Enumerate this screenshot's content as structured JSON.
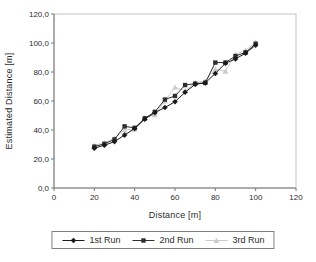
{
  "chart_data": {
    "type": "line",
    "title": "",
    "xlabel": "Distance [m]",
    "ylabel": "Estimated Distance [m]",
    "xlim": [
      0,
      120
    ],
    "ylim": [
      0,
      120
    ],
    "grid": false,
    "legend_position": "bottom",
    "x_tick_labels": [
      "0",
      "20",
      "40",
      "60",
      "80",
      "100",
      "120"
    ],
    "y_tick_labels": [
      "0,0",
      "20,0",
      "40,0",
      "60,0",
      "80,0",
      "100,0",
      "120,0"
    ],
    "x": [
      20,
      25,
      30,
      35,
      40,
      45,
      50,
      55,
      60,
      65,
      70,
      75,
      80,
      85,
      90,
      95,
      100
    ],
    "series": [
      {
        "name": "1st Run",
        "marker": "diamond",
        "color": "#1a1a1a",
        "values": [
          27.5,
          29.5,
          32,
          36.5,
          41,
          47.5,
          52,
          55.5,
          59.5,
          66,
          71.5,
          72.5,
          79,
          86,
          89,
          93,
          98.5
        ]
      },
      {
        "name": "2nd Run",
        "marker": "square",
        "color": "#2e2e2e",
        "values": [
          28.5,
          30.5,
          33.5,
          42.5,
          41.5,
          48,
          52.5,
          61,
          63.5,
          71,
          72,
          72.5,
          86.5,
          86.5,
          91,
          93.5,
          99.5
        ]
      },
      {
        "name": "3rd Run",
        "marker": "triangle",
        "color": "#cbcbcb",
        "values": [
          29.5,
          31,
          34.5,
          40,
          40.5,
          48.5,
          50.5,
          60,
          69.5,
          67,
          72.5,
          74,
          82,
          80.5,
          92,
          95,
          100.5
        ]
      }
    ],
    "colors": {
      "axis_line": "#777777",
      "plot_border": "#c4c4c4",
      "tick_text": "#2b2b2b",
      "background": "#ffffff"
    }
  }
}
